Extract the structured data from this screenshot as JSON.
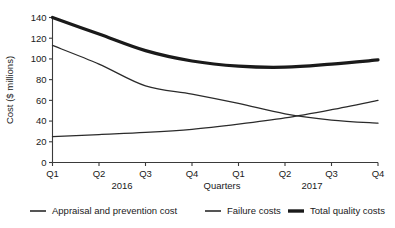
{
  "chart_data": {
    "type": "line",
    "title": "",
    "xlabel": "Quarters",
    "ylabel": "Cost ($ millions)",
    "categories": [
      "Q1",
      "Q2",
      "Q3",
      "Q4",
      "Q1",
      "Q2",
      "Q3",
      "Q4"
    ],
    "group_labels": [
      "2016",
      "2017"
    ],
    "ylim": [
      0,
      140
    ],
    "yticks": [
      0,
      20,
      40,
      60,
      80,
      100,
      120,
      140
    ],
    "ytick_labels": [
      "0",
      "20",
      "40",
      "60",
      "80",
      "100",
      "120",
      "140"
    ],
    "grid": false,
    "legend_position": "bottom",
    "series": [
      {
        "name": "Appraisal and prevention cost",
        "values": [
          25,
          27,
          29,
          32,
          37,
          43,
          51,
          60
        ],
        "color": "#2b2b2b",
        "width": 1.3
      },
      {
        "name": "Failure costs",
        "values": [
          113,
          95,
          74,
          66,
          57,
          47,
          41,
          38
        ],
        "color": "#2b2b2b",
        "width": 1.3
      },
      {
        "name": "Total quality costs",
        "values": [
          140,
          124,
          108,
          98,
          93,
          92,
          95,
          99
        ],
        "color": "#1a1a1a",
        "width": 3.2
      }
    ]
  },
  "legend": {
    "items": [
      {
        "label": "Appraisal and prevention cost",
        "width": 1.6
      },
      {
        "label": "Failure costs",
        "width": 1.6
      },
      {
        "label": "Total quality costs",
        "width": 3.4
      }
    ]
  }
}
